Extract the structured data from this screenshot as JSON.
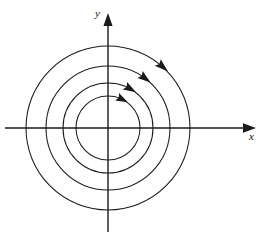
{
  "figure": {
    "name": "phase-portrait-concentric-circles",
    "background_color": "#ffffff",
    "stroke_color": "#1a1a1a"
  },
  "axes": {
    "x": {
      "label": "x",
      "origin_px": {
        "x": 108,
        "y": 128
      },
      "start_px": {
        "x": 5,
        "y": 128
      },
      "end_px": {
        "x": 256,
        "y": 128
      },
      "arrow": "right",
      "label_position_px": {
        "x": 249,
        "y": 131
      }
    },
    "y": {
      "label": "y",
      "origin_px": {
        "x": 108,
        "y": 128
      },
      "start_px": {
        "x": 108,
        "y": 232
      },
      "end_px": {
        "x": 108,
        "y": 14
      },
      "arrow": "up",
      "label_position_px": {
        "x": 95,
        "y": 8
      }
    }
  },
  "chart_data": {
    "type": "scatter",
    "title": "",
    "xlabel": "x",
    "ylabel": "y",
    "grid": false,
    "legend": null,
    "center": {
      "x": 108,
      "y": 128
    },
    "orbit_direction": "clockwise",
    "orbits": [
      {
        "id": "orbit-1",
        "radius": 32,
        "x_intercepts": [
          -32,
          32
        ],
        "y_intercepts": [
          -32,
          32
        ]
      },
      {
        "id": "orbit-2",
        "radius": 45,
        "x_intercepts": [
          -45,
          45
        ],
        "y_intercepts": [
          -45,
          45
        ]
      },
      {
        "id": "orbit-3",
        "radius": 62,
        "x_intercepts": [
          -62,
          62
        ],
        "y_intercepts": [
          -62,
          62
        ]
      },
      {
        "id": "orbit-4",
        "radius": 82,
        "x_intercepts": [
          -82,
          82
        ],
        "y_intercepts": [
          -82,
          82
        ]
      }
    ],
    "direction_arrows": [
      {
        "id": "arrow-orbit-1",
        "on_orbit": "orbit-1",
        "angle_deg": 63,
        "points": "clockwise"
      },
      {
        "id": "arrow-orbit-2",
        "on_orbit": "orbit-2",
        "angle_deg": 60,
        "points": "clockwise"
      },
      {
        "id": "arrow-orbit-3",
        "on_orbit": "orbit-3",
        "angle_deg": 53,
        "points": "clockwise"
      },
      {
        "id": "arrow-orbit-4",
        "on_orbit": "orbit-4",
        "angle_deg": 48,
        "points": "clockwise"
      }
    ]
  }
}
